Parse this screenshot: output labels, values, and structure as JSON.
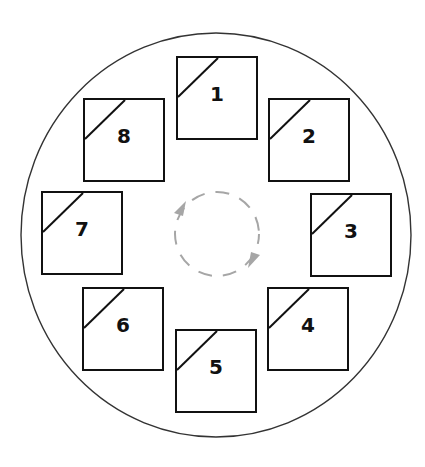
{
  "diagram": {
    "type": "carousel-rotation",
    "outer_ring": {
      "cx": 216,
      "cy": 235,
      "rx": 195,
      "ry": 202,
      "stroke": "#333333"
    },
    "rotation_indicator": {
      "direction": "clockwise",
      "cx": 217,
      "cy": 234,
      "r": 42,
      "color": "#a6a6a6"
    },
    "slots": [
      {
        "label": "1",
        "x": 176,
        "y": 56
      },
      {
        "label": "2",
        "x": 268,
        "y": 98
      },
      {
        "label": "3",
        "x": 310,
        "y": 193
      },
      {
        "label": "4",
        "x": 267,
        "y": 287
      },
      {
        "label": "5",
        "x": 175,
        "y": 329
      },
      {
        "label": "6",
        "x": 82,
        "y": 287
      },
      {
        "label": "7",
        "x": 41,
        "y": 191
      },
      {
        "label": "8",
        "x": 83,
        "y": 98
      }
    ]
  }
}
